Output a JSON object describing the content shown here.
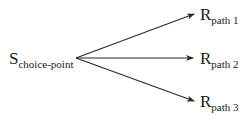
{
  "diagram": {
    "type": "branching-arrows",
    "source": {
      "main": "S",
      "subscript": "choice-point"
    },
    "targets": [
      {
        "main": "R",
        "subscript": "path 1"
      },
      {
        "main": "R",
        "subscript": "path 2"
      },
      {
        "main": "R",
        "subscript": "path 3"
      }
    ],
    "edges": [
      {
        "from": "S_choice-point",
        "to": "R_path 1"
      },
      {
        "from": "S_choice-point",
        "to": "R_path 2"
      },
      {
        "from": "S_choice-point",
        "to": "R_path 3"
      }
    ],
    "colors": {
      "text": "#1a1a1a",
      "arrow": "#2a2a2a",
      "background": "#ffffff"
    }
  }
}
